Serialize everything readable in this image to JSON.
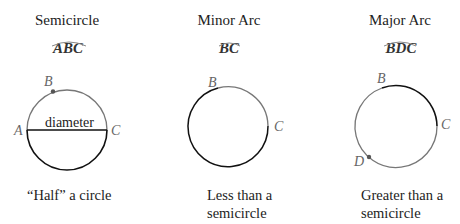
{
  "panels": [
    {
      "title": "Semicircle",
      "arc_name": "ABC",
      "caption_lines": [
        "“Half” a circle"
      ],
      "points": {
        "B": "B",
        "A": "A",
        "C": "C"
      },
      "segment_label": "diameter"
    },
    {
      "title": "Minor Arc",
      "arc_name": "BC",
      "caption_lines": [
        "Less than a",
        "semicircle"
      ],
      "points": {
        "B": "B",
        "C": "C"
      }
    },
    {
      "title": "Major Arc",
      "arc_name": "BDC",
      "caption_lines": [
        "Greater than a",
        "semicircle"
      ],
      "points": {
        "B": "B",
        "C": "C",
        "D": "D"
      }
    }
  ],
  "colors": {
    "arc_highlight": "#111111",
    "arc_rest": "#7a7a7a",
    "point": "#555555"
  }
}
